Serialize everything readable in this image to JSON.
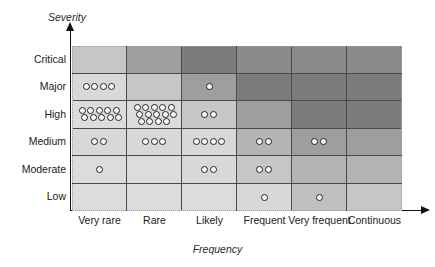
{
  "chart_data": {
    "type": "heatmap",
    "title": "",
    "xlabel": "Frequency",
    "ylabel": "Severity",
    "categories_x": [
      "Very rare",
      "Rare",
      "Likely",
      "Frequent",
      "Very frequent",
      "Continuous"
    ],
    "categories_y": [
      "Critical",
      "Major",
      "High",
      "Medium",
      "Moderate",
      "Low"
    ],
    "legend": [],
    "grid": true,
    "risk_shades": {
      "lightest": "#d8d8d8",
      "light": "#d0d0d0",
      "light_medium": "#c6c6c6",
      "medium": "#b4b4b4",
      "medium_dark": "#9e9e9e",
      "dark": "#8a8a8a",
      "darkest": "#7c7c7c"
    },
    "dot_style": {
      "fill": "#ffffff",
      "stroke": "#1f1f1f",
      "diameter_px": 7
    },
    "cells": [
      {
        "y": "Critical",
        "x": "Very rare",
        "shade": "#c6c6c6",
        "count": 0,
        "rows": []
      },
      {
        "y": "Critical",
        "x": "Rare",
        "shade": "#9e9e9e",
        "count": 0,
        "rows": []
      },
      {
        "y": "Critical",
        "x": "Likely",
        "shade": "#7c7c7c",
        "count": 0,
        "rows": []
      },
      {
        "y": "Critical",
        "x": "Frequent",
        "shade": "#8a8a8a",
        "count": 0,
        "rows": []
      },
      {
        "y": "Critical",
        "x": "Very frequent",
        "shade": "#8a8a8a",
        "count": 0,
        "rows": []
      },
      {
        "y": "Critical",
        "x": "Continuous",
        "shade": "#8a8a8a",
        "count": 0,
        "rows": []
      },
      {
        "y": "Major",
        "x": "Very rare",
        "shade": "#d8d8d8",
        "count": 4,
        "rows": [
          4
        ]
      },
      {
        "y": "Major",
        "x": "Rare",
        "shade": "#c6c6c6",
        "count": 0,
        "rows": []
      },
      {
        "y": "Major",
        "x": "Likely",
        "shade": "#9e9e9e",
        "count": 1,
        "rows": [
          1
        ]
      },
      {
        "y": "Major",
        "x": "Frequent",
        "shade": "#7c7c7c",
        "count": 0,
        "rows": []
      },
      {
        "y": "Major",
        "x": "Very frequent",
        "shade": "#7c7c7c",
        "count": 0,
        "rows": []
      },
      {
        "y": "Major",
        "x": "Continuous",
        "shade": "#7c7c7c",
        "count": 0,
        "rows": []
      },
      {
        "y": "High",
        "x": "Very rare",
        "shade": "#dcdcdc",
        "count": 10,
        "rows": [
          5,
          5
        ]
      },
      {
        "y": "High",
        "x": "Rare",
        "shade": "#dcdcdc",
        "count": 14,
        "rows": [
          5,
          5,
          4
        ]
      },
      {
        "y": "High",
        "x": "Likely",
        "shade": "#c6c6c6",
        "count": 2,
        "rows": [
          2
        ]
      },
      {
        "y": "High",
        "x": "Frequent",
        "shade": "#9e9e9e",
        "count": 0,
        "rows": []
      },
      {
        "y": "High",
        "x": "Very frequent",
        "shade": "#7c7c7c",
        "count": 0,
        "rows": []
      },
      {
        "y": "High",
        "x": "Continuous",
        "shade": "#7c7c7c",
        "count": 0,
        "rows": []
      },
      {
        "y": "Medium",
        "x": "Very rare",
        "shade": "#d8d8d8",
        "count": 2,
        "rows": [
          2
        ]
      },
      {
        "y": "Medium",
        "x": "Rare",
        "shade": "#d8d8d8",
        "count": 3,
        "rows": [
          3
        ]
      },
      {
        "y": "Medium",
        "x": "Likely",
        "shade": "#d8d8d8",
        "count": 4,
        "rows": [
          4
        ]
      },
      {
        "y": "Medium",
        "x": "Frequent",
        "shade": "#b4b4b4",
        "count": 2,
        "rows": [
          2
        ]
      },
      {
        "y": "Medium",
        "x": "Very frequent",
        "shade": "#9e9e9e",
        "count": 2,
        "rows": [
          2
        ]
      },
      {
        "y": "Medium",
        "x": "Continuous",
        "shade": "#9e9e9e",
        "count": 0,
        "rows": []
      },
      {
        "y": "Moderate",
        "x": "Very rare",
        "shade": "#dcdcdc",
        "count": 1,
        "rows": [
          1
        ]
      },
      {
        "y": "Moderate",
        "x": "Rare",
        "shade": "#dcdcdc",
        "count": 0,
        "rows": []
      },
      {
        "y": "Moderate",
        "x": "Likely",
        "shade": "#d8d8d8",
        "count": 2,
        "rows": [
          2
        ]
      },
      {
        "y": "Moderate",
        "x": "Frequent",
        "shade": "#c6c6c6",
        "count": 2,
        "rows": [
          2
        ]
      },
      {
        "y": "Moderate",
        "x": "Very frequent",
        "shade": "#b4b4b4",
        "count": 0,
        "rows": []
      },
      {
        "y": "Moderate",
        "x": "Continuous",
        "shade": "#b4b4b4",
        "count": 0,
        "rows": []
      },
      {
        "y": "Low",
        "x": "Very rare",
        "shade": "#dcdcdc",
        "count": 0,
        "rows": []
      },
      {
        "y": "Low",
        "x": "Rare",
        "shade": "#dcdcdc",
        "count": 0,
        "rows": []
      },
      {
        "y": "Low",
        "x": "Likely",
        "shade": "#dcdcdc",
        "count": 0,
        "rows": []
      },
      {
        "y": "Low",
        "x": "Frequent",
        "shade": "#d8d8d8",
        "count": 1,
        "rows": [
          1
        ]
      },
      {
        "y": "Low",
        "x": "Very frequent",
        "shade": "#c0c0c0",
        "count": 1,
        "rows": [
          1
        ]
      },
      {
        "y": "Low",
        "x": "Continuous",
        "shade": "#c6c6c6",
        "count": 0,
        "rows": []
      }
    ]
  },
  "axes": {
    "y_title": "Severity",
    "x_title": "Frequency"
  }
}
